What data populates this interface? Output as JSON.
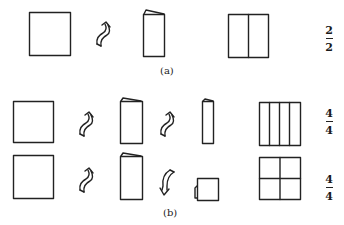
{
  "figure": {
    "panels": [
      {
        "id": "a",
        "label": "(a)",
        "rows": [
          {
            "steps": [
              "square-sheet",
              "fold-arrow-up",
              "folded-in-half",
              "unfolded-two-halves"
            ],
            "fraction": {
              "numerator": "2",
              "denominator": "2"
            }
          }
        ]
      },
      {
        "id": "b",
        "label": "(b)",
        "rows": [
          {
            "steps": [
              "square-sheet",
              "fold-arrow-up",
              "folded-in-half",
              "fold-arrow-up",
              "folded-in-quarter-strip",
              "unfolded-four-strips"
            ],
            "fraction": {
              "numerator": "4",
              "denominator": "4"
            }
          },
          {
            "steps": [
              "square-sheet",
              "fold-arrow-up",
              "folded-in-half",
              "fold-arrow-down",
              "folded-small-square",
              "unfolded-four-quadrants"
            ],
            "fraction": {
              "numerator": "4",
              "denominator": "4"
            }
          }
        ]
      }
    ]
  }
}
